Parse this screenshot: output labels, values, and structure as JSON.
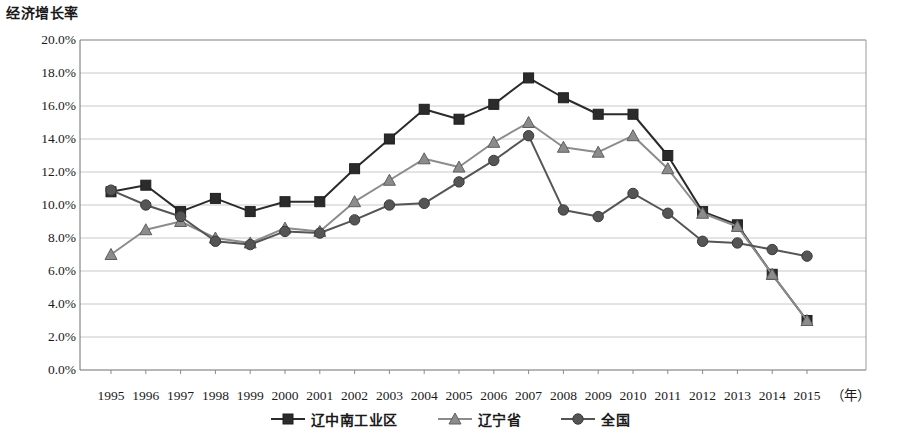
{
  "chart_data": {
    "type": "line",
    "title": "经济增长率",
    "xlabel": "（年）",
    "ylabel": "经济增长率",
    "ylim": [
      0,
      20
    ],
    "ytick_step": 2,
    "ytick_labels": [
      "20.0%",
      "18.0%",
      "16.0%",
      "14.0%",
      "12.0%",
      "10.0%",
      "8.0%",
      "6.0%",
      "4.0%",
      "2.0%",
      "0.0%"
    ],
    "grid": true,
    "legend_position": "bottom-center",
    "categories": [
      "1995",
      "1996",
      "1997",
      "1998",
      "1999",
      "2000",
      "2001",
      "2002",
      "2003",
      "2004",
      "2005",
      "2006",
      "2007",
      "2008",
      "2009",
      "2010",
      "2011",
      "2012",
      "2013",
      "2014",
      "2015"
    ],
    "series": [
      {
        "name": "辽中南工业区",
        "marker": "square",
        "color": "#2b2b2b",
        "values": [
          10.8,
          11.2,
          9.6,
          10.4,
          9.6,
          10.2,
          10.2,
          12.2,
          14.0,
          15.8,
          15.2,
          16.1,
          17.7,
          16.5,
          15.5,
          15.5,
          13.0,
          9.6,
          8.8,
          5.8,
          3.0
        ]
      },
      {
        "name": "辽宁省",
        "marker": "triangle",
        "color": "#8c8c8c",
        "values": [
          7.0,
          8.5,
          9.0,
          8.0,
          7.7,
          8.6,
          8.4,
          10.2,
          11.5,
          12.8,
          12.3,
          13.8,
          15.0,
          13.5,
          13.2,
          14.2,
          12.2,
          9.5,
          8.7,
          5.8,
          3.0
        ]
      },
      {
        "name": "全国",
        "marker": "circle",
        "color": "#555555",
        "values": [
          10.9,
          10.0,
          9.3,
          7.8,
          7.6,
          8.4,
          8.3,
          9.1,
          10.0,
          10.1,
          11.4,
          12.7,
          14.2,
          9.7,
          9.3,
          10.7,
          9.5,
          7.8,
          7.7,
          7.3,
          6.9
        ]
      }
    ]
  },
  "plot": {
    "x0": 80,
    "x1": 866,
    "y_top": 40,
    "y_bottom": 370,
    "first_tick_x": 111,
    "tick_spacing": 34.8,
    "frame_color": "#9a9a9a",
    "grid_color": "#c8c8c8"
  },
  "axis": {
    "unit_label": "（年）"
  }
}
